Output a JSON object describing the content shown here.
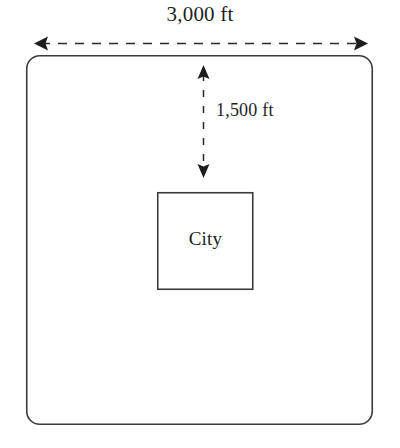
{
  "diagram": {
    "title_label": "3,000 ft",
    "vertical_label": "1,500 ft",
    "inner_label": "City",
    "colors": {
      "stroke": "#3d3a3a",
      "background": "#ffffff",
      "text": "#231f1f"
    },
    "outer_region": {
      "name": "county-boundary",
      "shape": "rounded-rectangle",
      "x": 26,
      "y": 55,
      "width": 347,
      "height": 370,
      "corner_radius": 13
    },
    "inner_region": {
      "name": "city-boundary",
      "shape": "rectangle",
      "x": 157,
      "y": 192,
      "width": 96,
      "height": 98
    },
    "width_dimension": {
      "name": "width-dimension",
      "value": "3,000 ft",
      "orientation": "horizontal",
      "x1": 35,
      "x2": 367,
      "y": 43,
      "style": "dashed-double-arrow"
    },
    "offset_dimension": {
      "name": "offset-dimension",
      "value": "1,500 ft",
      "orientation": "vertical",
      "x": 203,
      "y1": 66,
      "y2": 177,
      "style": "dashed-double-arrow"
    }
  }
}
